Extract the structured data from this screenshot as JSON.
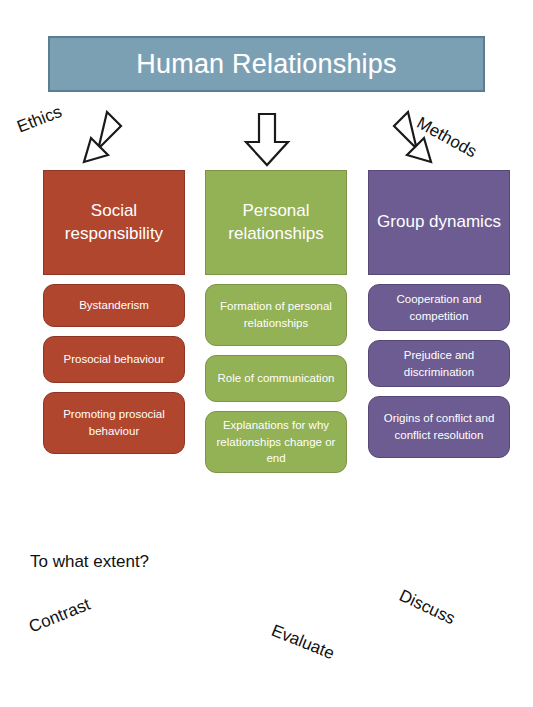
{
  "title": {
    "text": "Human Relationships",
    "fill_color": "#7ba0b4",
    "text_color": "#ffffff"
  },
  "connectors": [
    {
      "name": "ethics",
      "label": "Ethics",
      "arrow": "arrow-down-left-icon"
    },
    {
      "name": "middle",
      "label": "",
      "arrow": "arrow-down-icon"
    },
    {
      "name": "methods",
      "label": "Methods",
      "arrow": "arrow-down-right-icon"
    }
  ],
  "columns": [
    {
      "key": "social-responsibility",
      "heading": "Social responsibility",
      "color": "#b1462f",
      "topics": [
        "Bystanderism",
        "Prosocial behaviour",
        "Promoting prosocial behaviour"
      ]
    },
    {
      "key": "personal-relationships",
      "heading": "Personal relationships",
      "color": "#93b155",
      "topics": [
        "Formation of personal relationships",
        "Role of communication",
        "Explanations for why relationships change or end"
      ]
    },
    {
      "key": "group-dynamics",
      "heading": "Group dynamics",
      "color": "#6d5c92",
      "topics": [
        "Cooperation and competition",
        "Prejudice and discrimination",
        "Origins of conflict and conflict resolution"
      ]
    }
  ],
  "command_terms": {
    "to_what_extent": "To what extent?",
    "contrast": "Contrast",
    "evaluate": "Evaluate",
    "discuss": "Discuss"
  }
}
